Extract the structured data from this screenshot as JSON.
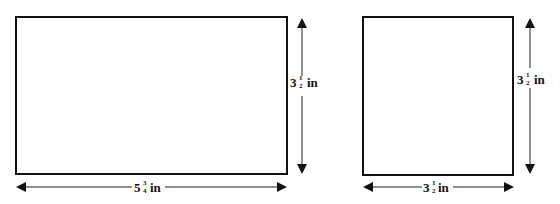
{
  "figures": [
    {
      "name": "rectangle",
      "width_label": {
        "whole": "5",
        "num": "3",
        "den": "4",
        "unit": "in"
      },
      "height_label": {
        "whole": "3",
        "num": "1",
        "den": "2",
        "unit": "in"
      },
      "note": "width fraction read as 3/4; low-resolution glyph, reading uncertain"
    },
    {
      "name": "square",
      "width_label": {
        "whole": "3",
        "num": "1",
        "den": "2",
        "unit": "in"
      },
      "height_label": {
        "whole": "3",
        "num": "1",
        "den": "2",
        "unit": "in"
      }
    }
  ],
  "colors": {
    "stroke": "#111111",
    "background": "#ffffff"
  }
}
